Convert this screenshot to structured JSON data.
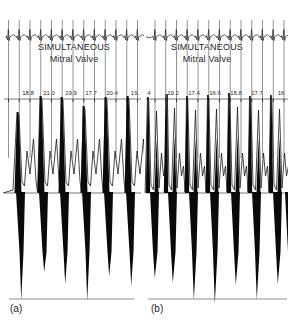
{
  "figure": {
    "background": "#ffffff",
    "ink": "#111111",
    "gridline_color": "#3d3d3d",
    "trace_color": "#1a1a1a"
  },
  "chart_data": [
    {
      "id": "a",
      "type": "line",
      "panel_label": "(a)",
      "title_line1": "SIMULTANEOUS",
      "title_line2": "Mitral Valve",
      "measurements": [
        18.8,
        21.0,
        19.9,
        17.7,
        20.4,
        19
      ],
      "values": [
        {
          "text": "18.8",
          "x": 28
        },
        {
          "text": "21.0",
          "x": 49
        },
        {
          "text": "19.9",
          "x": 71
        },
        {
          "text": "17.7",
          "x": 91
        },
        {
          "text": "20.4",
          "x": 112
        },
        {
          "text": "19.",
          "x": 135
        }
      ],
      "waveform": {
        "mode": "single-peak",
        "grid": {
          "start": 8.5,
          "step": 10.75,
          "count": 13,
          "y1": 20,
          "y2": 158
        },
        "ecg": {
          "x1": 6,
          "x2": 141,
          "y": 37
        },
        "ruler": {
          "x1": 4,
          "x2": 141,
          "y": 99
        },
        "baseline": {
          "x1": 4,
          "x2": 141,
          "y": 193
        },
        "bottom": {
          "x1": 9,
          "x2": 134,
          "y": 299
        },
        "env_start": 3,
        "env_end": 141,
        "beats": [
          {
            "x": 18,
            "e": 112,
            "tip": 300
          },
          {
            "x": 41,
            "e": 96,
            "tip": 272
          },
          {
            "x": 62,
            "e": 97,
            "tip": 284
          },
          {
            "x": 84,
            "e": 106,
            "tip": 301
          },
          {
            "x": 106,
            "e": 97,
            "tip": 276
          },
          {
            "x": 128,
            "e": 96,
            "tip": 286
          }
        ]
      }
    },
    {
      "id": "b",
      "type": "line",
      "panel_label": "(b)",
      "title_line1": "SIMULTANEOUS",
      "title_line2": "Mitral Valve",
      "measurements": [
        4,
        19.2,
        17.4,
        16.6,
        18.8,
        17.7,
        16
      ],
      "values": [
        {
          "text": "4",
          "x": 5
        },
        {
          "text": "19.2",
          "x": 29
        },
        {
          "text": "17.4",
          "x": 50
        },
        {
          "text": "16.6",
          "x": 71
        },
        {
          "text": "18.8",
          "x": 92
        },
        {
          "text": "17.7",
          "x": 113
        },
        {
          "text": "16",
          "x": 137
        }
      ],
      "waveform": {
        "mode": "double-peak",
        "grid": {
          "start": 11,
          "step": 10.75,
          "count": 13,
          "y1": 20,
          "y2": 158
        },
        "ecg": {
          "x1": 2,
          "x2": 143,
          "y": 37
        },
        "ruler": {
          "x1": 2,
          "x2": 144,
          "y": 99
        },
        "baseline": {
          "x1": 2,
          "x2": 144,
          "y": 193
        },
        "bottom": {
          "x1": 4,
          "x2": 143,
          "y": 299
        },
        "env_start": 1,
        "env_end": 144,
        "beats": [
          {
            "x": 4,
            "e": 97,
            "tip": 278
          },
          {
            "x": 22,
            "e": 94,
            "tip": 283
          },
          {
            "x": 43,
            "e": 96,
            "tip": 300
          },
          {
            "x": 64,
            "e": 95,
            "tip": 304
          },
          {
            "x": 85,
            "e": 93,
            "tip": 285
          },
          {
            "x": 106,
            "e": 96,
            "tip": 300
          },
          {
            "x": 127,
            "e": 95,
            "tip": 284
          },
          {
            "x": 139,
            "tip": 272,
            "col_only": true
          }
        ]
      }
    }
  ]
}
